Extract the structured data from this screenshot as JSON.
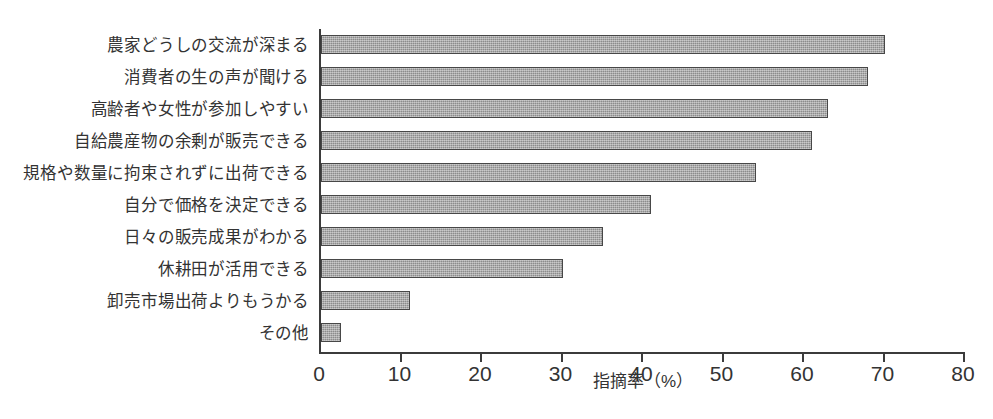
{
  "chart_data": {
    "type": "bar",
    "orientation": "horizontal",
    "title": "",
    "xlabel": "指摘率（%）",
    "ylabel": "",
    "xlim": [
      0,
      80
    ],
    "xticks": [
      0,
      10,
      20,
      30,
      40,
      50,
      60,
      70,
      80
    ],
    "xtick_labels": [
      "0",
      "10",
      "20",
      "30",
      "40",
      "50",
      "60",
      "70",
      "80"
    ],
    "grid": false,
    "legend": false,
    "categories": [
      "農家どうしの交流が深まる",
      "消費者の生の声が聞ける",
      "高齢者や女性が参加しやすい",
      "自給農産物の余剰が販売できる",
      "規格や数量に拘束されずに出荷できる",
      "自分で価格を決定できる",
      "日々の販売成果がわかる",
      "休耕田が活用できる",
      "卸売市場出荷よりもうかる",
      "その他"
    ],
    "values": [
      70,
      68,
      63,
      61,
      54,
      41,
      35,
      30,
      11,
      2.5
    ],
    "bar_color": "#9d9d9d",
    "bar_edge_color": "#474747",
    "axis_color": "#3b3b3b",
    "text_color": "#333333"
  }
}
